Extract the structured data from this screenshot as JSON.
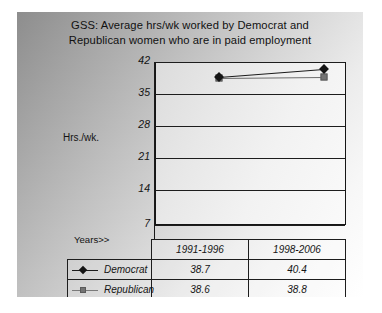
{
  "chart_data": {
    "type": "line",
    "title": "GSS: Average hrs/wk worked by Democrat and Republican women who are in paid employment",
    "title_line1": "GSS: Average hrs/wk worked by Democrat and",
    "title_line2": "Republican women who are in paid employment",
    "xlabel": "Years>>",
    "ylabel": "Hrs./wk.",
    "categories": [
      "1991-1996",
      "1998-2006"
    ],
    "yticks": [
      42,
      35,
      28,
      21,
      14,
      7
    ],
    "ylim": [
      7,
      42
    ],
    "grid": true,
    "legend_position": "table-below",
    "series": [
      {
        "name": "Democrat",
        "values": [
          38.7,
          40.4
        ],
        "marker": "diamond",
        "color": "#141414"
      },
      {
        "name": "Republican",
        "values": [
          38.6,
          38.8
        ],
        "marker": "square",
        "color": "#737373"
      }
    ]
  },
  "table": {
    "header": [
      "",
      "1991-1996",
      "1998-2006"
    ],
    "rows": [
      {
        "label": "Democrat",
        "values": [
          "38.7",
          "40.4"
        ]
      },
      {
        "label": "Republican",
        "values": [
          "38.6",
          "38.8"
        ]
      }
    ]
  }
}
